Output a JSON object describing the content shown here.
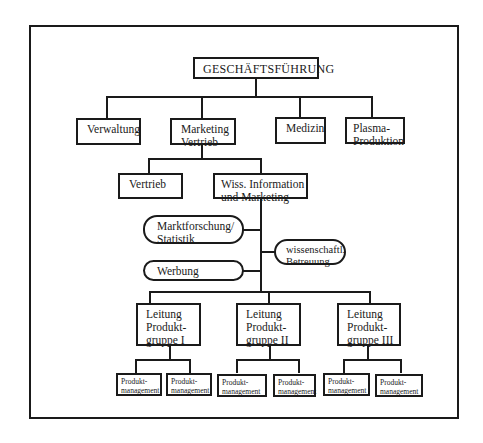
{
  "diagram": {
    "type": "organization-chart",
    "root": "GESCHÄFTSFÜHRUNG",
    "level1": [
      "Verwaltung",
      "Marketing\nVertrieb",
      "Medizin",
      "Plasma-\nProduktion"
    ],
    "marketing_children": [
      "Vertrieb",
      "Wiss. Information\nund Marketing"
    ],
    "wiss_children": {
      "left": [
        "Marktforschung/\nStatistik",
        "Werbung"
      ],
      "right": [
        "wissenschaftl.\nBetreuung"
      ]
    },
    "product_groups": [
      {
        "label": "Leitung\nProdukt-\ngruppe I",
        "children": [
          "Produkt-\nmanagement",
          "Produkt-\nmanagement"
        ]
      },
      {
        "label": "Leitung\nProdukt-\ngruppe II",
        "children": [
          "Produkt-\nmanagement",
          "Produkt-\nmanagement"
        ]
      },
      {
        "label": "Leitung\nProdukt-\ngruppe III",
        "children": [
          "Produkt-\nmanagement",
          "Produkt-\nmanagement"
        ]
      }
    ]
  }
}
